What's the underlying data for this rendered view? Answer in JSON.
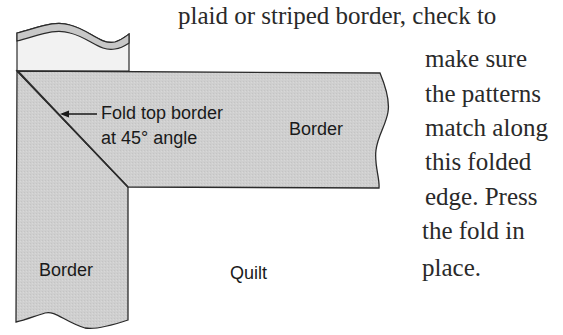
{
  "diagram": {
    "labels": {
      "fold_note_line1": "Fold top border",
      "fold_note_line2": "at 45° angle",
      "top_border": "Border",
      "side_border": "Border",
      "quilt": "Quilt"
    },
    "colors": {
      "border_fill": "#cfcfcf",
      "strip_fill": "#f2f2f2",
      "strip_band": "#c8c8c8",
      "outline": "#2b2b2b",
      "text": "#1a1a1a"
    }
  },
  "text": {
    "lines": [
      "plaid or striped border, check to",
      "make sure",
      "the patterns",
      "match along",
      "this folded",
      "edge. Press",
      "the fold in",
      "place."
    ]
  }
}
